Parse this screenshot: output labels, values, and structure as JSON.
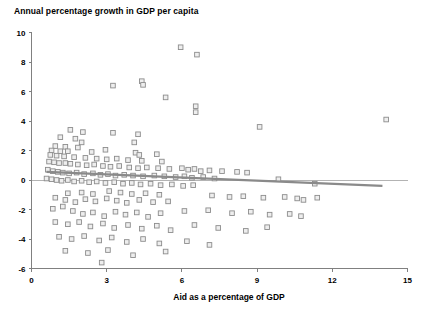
{
  "chart_data": {
    "type": "scatter",
    "title": "Annual percentage growth in GDP per capita",
    "xlabel": "Aid as a percentage of GDP",
    "ylabel": "",
    "xlim": [
      0,
      15
    ],
    "ylim": [
      -6,
      10
    ],
    "xticks": [
      0,
      3,
      6,
      9,
      12,
      15
    ],
    "yticks": [
      -6,
      -4,
      -2,
      0,
      2,
      4,
      6,
      8,
      10
    ],
    "xtick_labels": [
      "0",
      "3",
      "6",
      "9",
      "12",
      "15"
    ],
    "ytick_labels": [
      "-6",
      "-4",
      "-2",
      "0",
      "2",
      "4",
      "6",
      "8",
      "10"
    ],
    "grid": false,
    "legend": null,
    "zero_reference_line": 0,
    "marker_style": "open-square",
    "marker_fill": "#eeeeee",
    "marker_edge": "#8c8c8c",
    "trendline": {
      "type": "linear",
      "color": "#8a8a8a",
      "x_start": 0.6,
      "y_start": 0.55,
      "x_end": 14.0,
      "y_end": -0.4
    },
    "points": [
      [
        5.95,
        9.0
      ],
      [
        6.6,
        8.5
      ],
      [
        4.4,
        6.7
      ],
      [
        4.45,
        6.45
      ],
      [
        3.25,
        6.4
      ],
      [
        5.35,
        5.6
      ],
      [
        6.55,
        5.0
      ],
      [
        6.55,
        4.6
      ],
      [
        14.15,
        4.1
      ],
      [
        9.1,
        3.6
      ],
      [
        1.55,
        3.4
      ],
      [
        2.05,
        3.25
      ],
      [
        3.25,
        3.2
      ],
      [
        4.25,
        3.1
      ],
      [
        1.15,
        2.9
      ],
      [
        1.75,
        2.8
      ],
      [
        2.0,
        2.55
      ],
      [
        4.1,
        2.55
      ],
      [
        0.95,
        2.3
      ],
      [
        1.35,
        2.25
      ],
      [
        1.85,
        2.2
      ],
      [
        2.95,
        2.05
      ],
      [
        0.8,
        2.0
      ],
      [
        1.15,
        1.95
      ],
      [
        1.45,
        1.95
      ],
      [
        2.4,
        1.9
      ],
      [
        4.15,
        1.85
      ],
      [
        4.3,
        1.7
      ],
      [
        5.0,
        1.75
      ],
      [
        0.75,
        1.7
      ],
      [
        1.0,
        1.65
      ],
      [
        1.3,
        1.6
      ],
      [
        1.7,
        1.55
      ],
      [
        2.15,
        1.5
      ],
      [
        2.6,
        1.45
      ],
      [
        3.0,
        1.4
      ],
      [
        3.4,
        1.45
      ],
      [
        3.85,
        1.35
      ],
      [
        4.4,
        1.3
      ],
      [
        5.2,
        1.25
      ],
      [
        0.7,
        1.25
      ],
      [
        0.9,
        1.2
      ],
      [
        1.1,
        1.15
      ],
      [
        1.35,
        1.15
      ],
      [
        1.55,
        1.1
      ],
      [
        1.85,
        1.05
      ],
      [
        2.2,
        1.0
      ],
      [
        2.5,
        1.05
      ],
      [
        2.85,
        0.95
      ],
      [
        3.15,
        0.9
      ],
      [
        3.5,
        0.95
      ],
      [
        3.9,
        0.85
      ],
      [
        4.25,
        0.8
      ],
      [
        4.6,
        0.85
      ],
      [
        5.05,
        0.8
      ],
      [
        5.5,
        0.75
      ],
      [
        6.0,
        0.8
      ],
      [
        6.25,
        0.7
      ],
      [
        6.5,
        0.75
      ],
      [
        6.75,
        0.6
      ],
      [
        7.1,
        0.65
      ],
      [
        7.6,
        0.6
      ],
      [
        8.2,
        0.55
      ],
      [
        8.6,
        0.5
      ],
      [
        0.65,
        0.7
      ],
      [
        0.85,
        0.6
      ],
      [
        1.05,
        0.55
      ],
      [
        1.25,
        0.5
      ],
      [
        1.5,
        0.45
      ],
      [
        1.8,
        0.5
      ],
      [
        2.1,
        0.4
      ],
      [
        2.45,
        0.45
      ],
      [
        2.75,
        0.35
      ],
      [
        3.05,
        0.4
      ],
      [
        3.35,
        0.3
      ],
      [
        3.7,
        0.35
      ],
      [
        4.05,
        0.3
      ],
      [
        4.45,
        0.25
      ],
      [
        4.9,
        0.3
      ],
      [
        5.3,
        0.25
      ],
      [
        5.75,
        0.2
      ],
      [
        6.1,
        0.25
      ],
      [
        6.4,
        0.15
      ],
      [
        6.85,
        0.2
      ],
      [
        7.3,
        0.1
      ],
      [
        9.85,
        0.05
      ],
      [
        11.3,
        -0.25
      ],
      [
        0.6,
        0.1
      ],
      [
        0.8,
        0.05
      ],
      [
        1.0,
        0.0
      ],
      [
        1.2,
        -0.05
      ],
      [
        1.45,
        0.0
      ],
      [
        1.7,
        -0.1
      ],
      [
        2.0,
        -0.05
      ],
      [
        2.3,
        -0.15
      ],
      [
        2.6,
        -0.1
      ],
      [
        2.95,
        -0.2
      ],
      [
        3.3,
        -0.15
      ],
      [
        3.65,
        -0.25
      ],
      [
        4.0,
        -0.2
      ],
      [
        4.35,
        -0.3
      ],
      [
        4.75,
        -0.25
      ],
      [
        5.15,
        -0.35
      ],
      [
        5.6,
        -0.3
      ],
      [
        6.05,
        -0.4
      ],
      [
        6.45,
        -0.35
      ],
      [
        1.45,
        -0.9
      ],
      [
        2.0,
        -0.85
      ],
      [
        2.45,
        -0.95
      ],
      [
        3.1,
        -0.75
      ],
      [
        3.55,
        -0.85
      ],
      [
        4.0,
        -0.95
      ],
      [
        4.55,
        -0.9
      ],
      [
        5.1,
        -1.0
      ],
      [
        0.95,
        -1.2
      ],
      [
        1.35,
        -1.35
      ],
      [
        1.75,
        -1.5
      ],
      [
        2.15,
        -1.3
      ],
      [
        2.55,
        -1.45
      ],
      [
        3.0,
        -1.25
      ],
      [
        3.4,
        -1.4
      ],
      [
        3.8,
        -1.55
      ],
      [
        4.3,
        -1.35
      ],
      [
        4.85,
        -1.5
      ],
      [
        5.45,
        -1.45
      ],
      [
        7.2,
        -1.05
      ],
      [
        7.9,
        -1.15
      ],
      [
        8.45,
        -1.1
      ],
      [
        9.25,
        -1.2
      ],
      [
        10.1,
        -1.15
      ],
      [
        10.6,
        -1.25
      ],
      [
        10.85,
        -1.35
      ],
      [
        11.4,
        -1.2
      ],
      [
        0.85,
        -1.95
      ],
      [
        1.25,
        -1.8
      ],
      [
        1.65,
        -2.1
      ],
      [
        2.05,
        -2.3
      ],
      [
        2.45,
        -2.2
      ],
      [
        2.9,
        -2.45
      ],
      [
        3.35,
        -2.15
      ],
      [
        3.75,
        -2.35
      ],
      [
        4.2,
        -2.2
      ],
      [
        4.65,
        -2.5
      ],
      [
        5.15,
        -2.25
      ],
      [
        6.1,
        -2.1
      ],
      [
        7.05,
        -2.05
      ],
      [
        8.0,
        -2.25
      ],
      [
        8.75,
        -2.15
      ],
      [
        9.5,
        -2.35
      ],
      [
        10.3,
        -2.3
      ],
      [
        10.75,
        -2.45
      ],
      [
        0.95,
        -2.85
      ],
      [
        1.45,
        -3.0
      ],
      [
        1.9,
        -2.85
      ],
      [
        2.35,
        -3.15
      ],
      [
        2.85,
        -2.95
      ],
      [
        3.3,
        -3.25
      ],
      [
        3.85,
        -3.05
      ],
      [
        4.4,
        -3.3
      ],
      [
        5.0,
        -3.1
      ],
      [
        5.55,
        -3.4
      ],
      [
        6.5,
        -3.05
      ],
      [
        7.45,
        -3.25
      ],
      [
        8.55,
        -3.45
      ],
      [
        9.4,
        -3.2
      ],
      [
        1.1,
        -3.85
      ],
      [
        1.6,
        -4.0
      ],
      [
        2.1,
        -3.8
      ],
      [
        2.7,
        -4.1
      ],
      [
        3.2,
        -3.9
      ],
      [
        3.8,
        -4.2
      ],
      [
        4.45,
        -4.0
      ],
      [
        5.1,
        -4.3
      ],
      [
        6.2,
        -4.15
      ],
      [
        7.1,
        -4.4
      ],
      [
        1.35,
        -4.8
      ],
      [
        2.25,
        -4.95
      ],
      [
        3.05,
        -4.75
      ],
      [
        4.05,
        -5.1
      ],
      [
        5.35,
        -4.85
      ],
      [
        2.8,
        -5.6
      ]
    ]
  }
}
